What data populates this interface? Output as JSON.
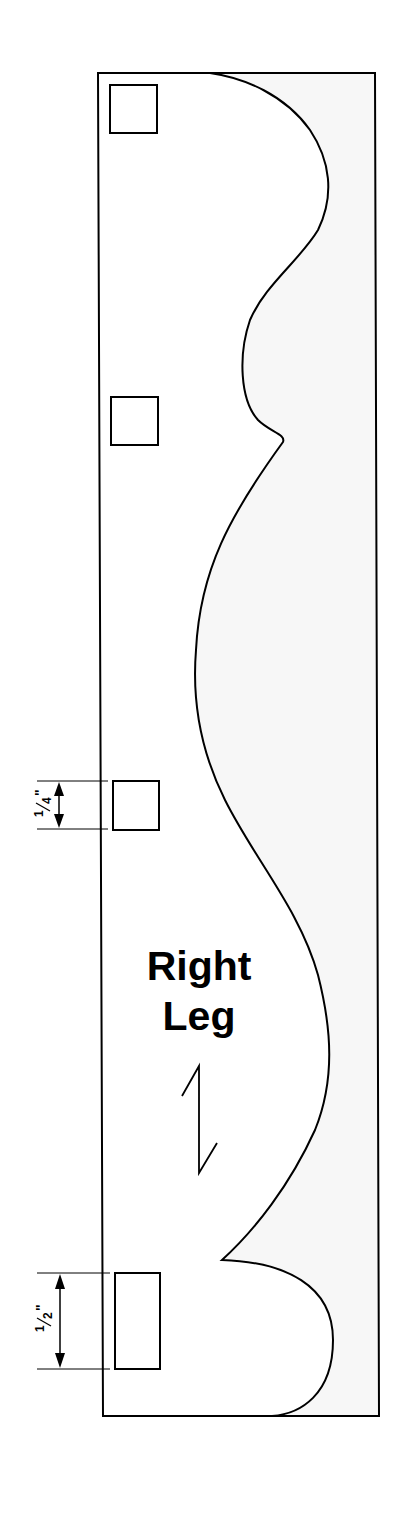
{
  "pattern": {
    "title_line1": "Right",
    "title_line2": "Leg",
    "colors": {
      "stroke": "#000000",
      "waste_fill": "#f7f7f7",
      "piece_fill": "#ffffff"
    }
  },
  "dimensions": {
    "quarter_inch": {
      "whole": "1",
      "fraction": "4",
      "unit": "\"",
      "label": "1/4\""
    },
    "half_inch": {
      "whole": "1",
      "fraction": "2",
      "unit": "\"",
      "label": "1/2\""
    }
  },
  "mortises": [
    {
      "name": "mortise-1",
      "x": 110,
      "y": 85,
      "w": 47,
      "h": 48
    },
    {
      "name": "mortise-2",
      "x": 111,
      "y": 397,
      "w": 47,
      "h": 48
    },
    {
      "name": "mortise-3",
      "x": 113,
      "y": 781,
      "w": 46,
      "h": 49
    },
    {
      "name": "mortise-4",
      "x": 115,
      "y": 1273,
      "w": 45,
      "h": 96
    }
  ],
  "grain_direction": {
    "icon": "grain-arrow-icon"
  }
}
